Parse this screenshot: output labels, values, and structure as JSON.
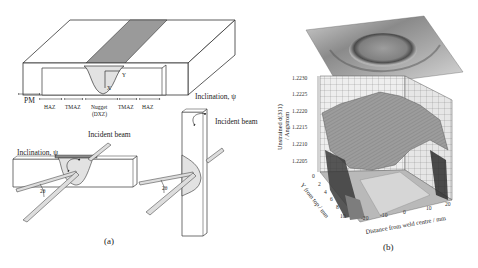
{
  "panel_a": {
    "caption": "(a)",
    "schematic": {
      "coord_labels": {
        "x": "X",
        "y": "Y"
      },
      "zones": {
        "pm": "PM",
        "haz_left": "HAZ",
        "tmaz_left": "TMAZ",
        "nugget": "Nugget",
        "nugget_sub": "(DXZ)",
        "tmaz_right": "TMAZ",
        "haz_right": "HAZ"
      }
    },
    "setup_horizontal": {
      "inclination_label": "Inclination, ψ",
      "beam_label": "Incident beam",
      "angle_label": "2θ"
    },
    "setup_vertical": {
      "inclination_label": "Inclination, ψ",
      "beam_label": "Incident beam",
      "angle_label": "2θ"
    }
  },
  "panel_b": {
    "caption": "(b)",
    "z_axis_label_line1": "Unstrained d(311)",
    "z_axis_label_line2": "/ Angstrom",
    "z_ticks": [
      "1.2230",
      "1.2225",
      "1.2220",
      "1.2215",
      "1.2210",
      "1.2205"
    ],
    "y_axis_label": "Y from top / mm",
    "y_ticks": [
      "0",
      "2",
      "4",
      "6",
      "8",
      "10"
    ],
    "x_axis_label": "Distance from weld centre / mm",
    "x_ticks": [
      "-20",
      "-10",
      "0",
      "10",
      "20"
    ]
  },
  "colors": {
    "weld_stripe": "#9a9a9a",
    "nugget_fill": "#e2e2e2",
    "surface_dark": "#3a3a3a",
    "surface_mid": "#8c8c8c",
    "surface_light": "#c9c9c9"
  }
}
